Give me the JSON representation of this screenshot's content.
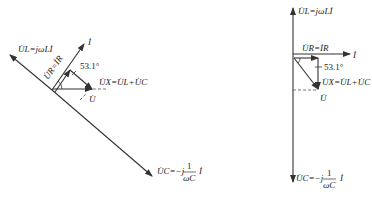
{
  "diagrams": [
    {
      "name": "left-phasor-diagram",
      "labels": {
        "UL": "U̇L=jωLİ",
        "I": "İ",
        "UR": "U̇R=İR",
        "angle": "53.1°",
        "UX": "U̇X=U̇L+U̇C",
        "U": "U̇",
        "UC": "U̇C=−j",
        "UC_frac_num": "1",
        "UC_frac_den": "ωC",
        "UC_suffix": "İ"
      }
    },
    {
      "name": "right-phasor-diagram",
      "labels": {
        "UL": "U̇L=jωLİ",
        "I": "İ",
        "UR": "U̇R=İR",
        "angle": "53.1°",
        "UX": "U̇X=U̇L+U̇C",
        "U": "U̇",
        "UC": "U̇C=−j",
        "UC_frac_num": "1",
        "UC_frac_den": "ωC",
        "UC_suffix": "İ"
      }
    }
  ]
}
